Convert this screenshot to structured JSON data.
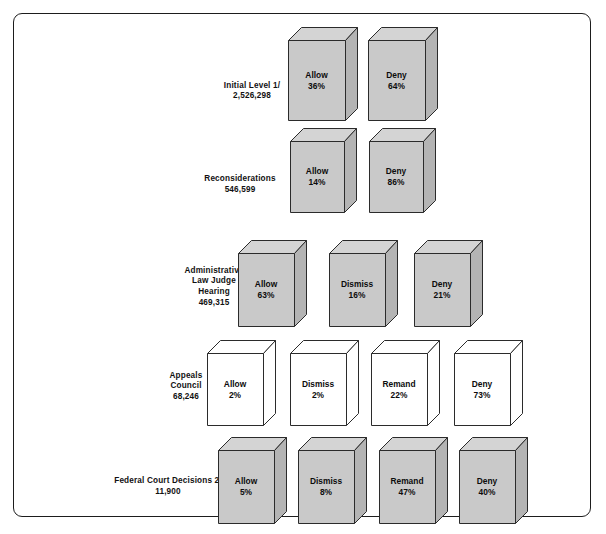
{
  "figure": {
    "frame_color": "#1d1d1d",
    "fill_shaded": "#c9c9c9",
    "fill_white": "#ffffff"
  },
  "chart_data": {
    "type": "diagram",
    "title": "",
    "subtitle": "",
    "xlabel": "",
    "ylabel": "",
    "legend": [],
    "grid": false,
    "note_markers": [
      "1/",
      "2/"
    ],
    "stages": [
      {
        "label_lines": [
          "Initial Level 1/",
          "2,526,298"
        ],
        "name": "Initial Level",
        "count": "2,526,298",
        "style": "shaded",
        "outcomes": [
          {
            "outcome": "Allow",
            "pct": "36%",
            "value": 36
          },
          {
            "outcome": "Deny",
            "pct": "64%",
            "value": 64
          }
        ]
      },
      {
        "label_lines": [
          "Reconsiderations",
          "546,599"
        ],
        "name": "Reconsiderations",
        "count": "546,599",
        "style": "shaded",
        "outcomes": [
          {
            "outcome": "Allow",
            "pct": "14%",
            "value": 14
          },
          {
            "outcome": "Deny",
            "pct": "86%",
            "value": 86
          }
        ]
      },
      {
        "label_lines": [
          "Administrative",
          "Law Judge",
          "Hearing",
          "469,315"
        ],
        "name": "Administrative Law Judge Hearing",
        "count": "469,315",
        "style": "shaded",
        "outcomes": [
          {
            "outcome": "Allow",
            "pct": "63%",
            "value": 63
          },
          {
            "outcome": "Dismiss",
            "pct": "16%",
            "value": 16
          },
          {
            "outcome": "Deny",
            "pct": "21%",
            "value": 21
          }
        ]
      },
      {
        "label_lines": [
          "Appeals",
          "Council",
          "68,246"
        ],
        "name": "Appeals Council",
        "count": "68,246",
        "style": "white",
        "outcomes": [
          {
            "outcome": "Allow",
            "pct": "2%",
            "value": 2
          },
          {
            "outcome": "Dismiss",
            "pct": "2%",
            "value": 2
          },
          {
            "outcome": "Remand",
            "pct": "22%",
            "value": 22
          },
          {
            "outcome": "Deny",
            "pct": "73%",
            "value": 73
          }
        ]
      },
      {
        "label_lines": [
          "Federal Court Decisions 2/",
          "11,900"
        ],
        "name": "Federal Court Decisions",
        "count": "11,900",
        "style": "shaded",
        "outcomes": [
          {
            "outcome": "Allow",
            "pct": "5%",
            "value": 5
          },
          {
            "outcome": "Dismiss",
            "pct": "8%",
            "value": 8
          },
          {
            "outcome": "Remand",
            "pct": "47%",
            "value": 47
          },
          {
            "outcome": "Deny",
            "pct": "40%",
            "value": 40
          }
        ]
      }
    ]
  }
}
